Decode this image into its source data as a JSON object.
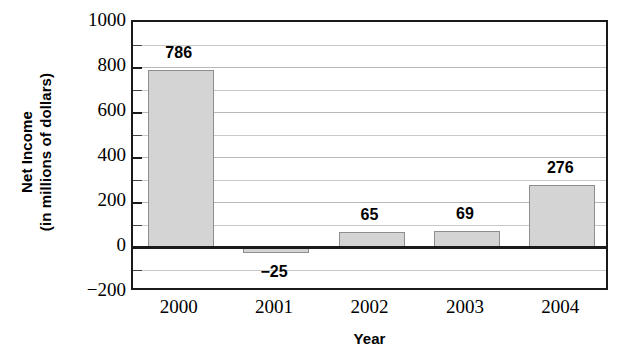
{
  "chart_data": {
    "type": "bar",
    "title": "",
    "xlabel": "Year",
    "ylabel": "Net Income\n(in millions of dollars)",
    "ylabel_line1": "Net Income",
    "ylabel_line2": "(in millions of dollars)",
    "categories": [
      "2000",
      "2001",
      "2002",
      "2003",
      "2004"
    ],
    "values": [
      786,
      -25,
      65,
      69,
      276
    ],
    "value_labels": [
      "786",
      "−25",
      "65",
      "69",
      "276"
    ],
    "series": [
      {
        "name": "Net Income",
        "values": [
          786,
          -25,
          65,
          69,
          276
        ]
      }
    ],
    "ylim": [
      -200,
      1000
    ],
    "y_tick_labels": [
      "1000",
      "800",
      "600",
      "400",
      "200",
      "0",
      "−200"
    ],
    "y_tick_values": [
      1000,
      800,
      600,
      400,
      200,
      0,
      -200
    ],
    "y_major_step": 200,
    "y_minor_step": 100,
    "grid": true,
    "grid_axis": "y",
    "legend": "none",
    "bar_fill_color": "#d4d4d4",
    "bar_edge_color": "#8e8e8e",
    "gridline_color": "#c9c9c9",
    "axis_color": "#1a1a1a"
  }
}
